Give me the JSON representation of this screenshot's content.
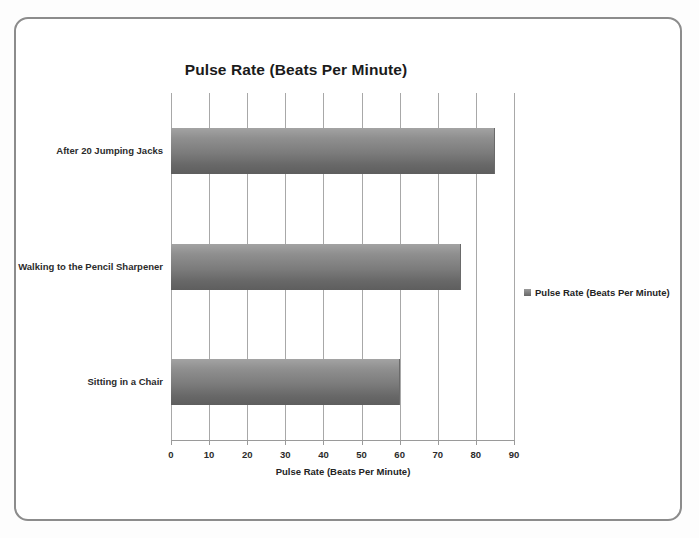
{
  "chart_data": {
    "type": "bar",
    "orientation": "horizontal",
    "title": "Pulse Rate (Beats Per Minute)",
    "xlabel": "Pulse Rate (Beats Per Minute)",
    "ylabel": "",
    "categories": [
      "After 20 Jumping Jacks",
      "Walking to the Pencil Sharpener",
      "Sitting in a Chair"
    ],
    "values": [
      85,
      76,
      60
    ],
    "series": [
      {
        "name": "Pulse Rate (Beats Per Minute)",
        "values": [
          85,
          76,
          60
        ]
      }
    ],
    "xlim": [
      0,
      90
    ],
    "xticks": [
      0,
      10,
      20,
      30,
      40,
      50,
      60,
      70,
      80,
      90
    ],
    "xtick_labels": [
      "0",
      "10",
      "20",
      "30",
      "40",
      "50",
      "60",
      "70",
      "80",
      "90"
    ],
    "grid": "vertical",
    "legend": {
      "position": "right",
      "entries": [
        "Pulse Rate (Beats Per Minute)"
      ]
    },
    "colors": {
      "bar_light": "#a3a3a3",
      "bar_dark": "#5e5e5e",
      "gridline": "#a8a8a8",
      "text": "#2b2b2b",
      "frame_border": "#8c8c8c",
      "background": "#ffffff"
    }
  }
}
